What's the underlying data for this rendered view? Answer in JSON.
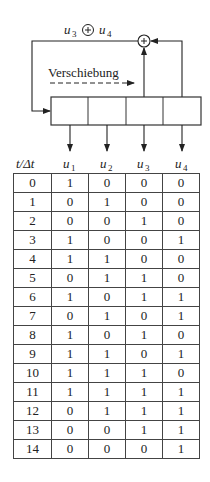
{
  "diagram": {
    "feedback_label": {
      "left": "u",
      "left_sub": "3",
      "op": "⊕",
      "right": "u",
      "right_sub": "4"
    },
    "shift_label": "Verschiebung",
    "xor_symbol": "+",
    "register_cells": 4
  },
  "table": {
    "header": {
      "time": "t/Δt",
      "cols": [
        {
          "var": "u",
          "sub": "1"
        },
        {
          "var": "u",
          "sub": "2"
        },
        {
          "var": "u",
          "sub": "3"
        },
        {
          "var": "u",
          "sub": "4"
        }
      ]
    },
    "rows": [
      [
        "0",
        "1",
        "0",
        "0",
        "0"
      ],
      [
        "1",
        "0",
        "1",
        "0",
        "0"
      ],
      [
        "2",
        "0",
        "0",
        "1",
        "0"
      ],
      [
        "3",
        "1",
        "0",
        "0",
        "1"
      ],
      [
        "4",
        "1",
        "1",
        "0",
        "0"
      ],
      [
        "5",
        "0",
        "1",
        "1",
        "0"
      ],
      [
        "6",
        "1",
        "0",
        "1",
        "1"
      ],
      [
        "7",
        "0",
        "1",
        "0",
        "1"
      ],
      [
        "8",
        "1",
        "0",
        "1",
        "0"
      ],
      [
        "9",
        "1",
        "1",
        "0",
        "1"
      ],
      [
        "10",
        "1",
        "1",
        "1",
        "0"
      ],
      [
        "11",
        "1",
        "1",
        "1",
        "1"
      ],
      [
        "12",
        "0",
        "1",
        "1",
        "1"
      ],
      [
        "13",
        "0",
        "0",
        "1",
        "1"
      ],
      [
        "14",
        "0",
        "0",
        "0",
        "1"
      ]
    ]
  }
}
